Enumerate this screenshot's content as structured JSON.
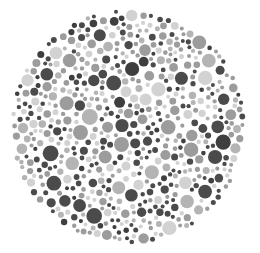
{
  "image": {
    "description": "Grayscale Ishihara-style dot plate (circular field of dots)",
    "width": 260,
    "height": 253,
    "background": "#ffffff"
  },
  "plate": {
    "center": [
      128,
      127
    ],
    "radius": 118,
    "palette": {
      "dark": "#4b4b4b",
      "darker": "#3f3f3f",
      "mid": "#9c9c9c",
      "midlight": "#b4b4b4",
      "light": "#d2d2d2"
    },
    "palette_weights": [
      0.28,
      0.08,
      0.3,
      0.16,
      0.18
    ],
    "dot_radius_range": [
      2,
      8
    ],
    "seed": 7
  }
}
